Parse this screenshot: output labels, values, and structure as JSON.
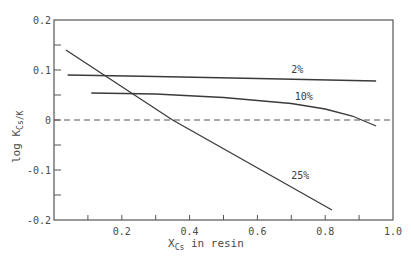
{
  "chart_data": {
    "type": "line",
    "title": "",
    "xlabel": "X_Cs in resin",
    "xlabel_main": "X",
    "xlabel_sub": "Cs",
    "xlabel_rest": " in resin",
    "ylabel": "log K_Cs/K",
    "ylabel_main": "log K",
    "ylabel_sub": "Cs/K",
    "xlim": [
      0.0,
      1.0
    ],
    "ylim": [
      -0.2,
      0.2
    ],
    "x_ticks": [
      0.2,
      0.4,
      0.6,
      0.8,
      1.0
    ],
    "x_tick_labels": [
      "0.2",
      "0.4",
      "0.6",
      "0.8",
      "1.0"
    ],
    "x_minor_ticks": [
      0.1,
      0.3,
      0.5,
      0.7,
      0.9
    ],
    "y_ticks": [
      -0.2,
      -0.1,
      0,
      0.1,
      0.2
    ],
    "y_tick_labels": [
      "-0.2",
      "-0.1",
      "0",
      "0.1",
      "0.2"
    ],
    "y_minor_ticks": [
      -0.15,
      -0.05,
      0.05,
      0.15
    ],
    "grid": false,
    "legend": "inline labels",
    "reference_line": {
      "y": 0,
      "style": "dashed"
    },
    "series": [
      {
        "name": "2%",
        "x": [
          0.04,
          0.3,
          0.6,
          0.95
        ],
        "y": [
          0.09,
          0.087,
          0.083,
          0.078
        ],
        "label_pos": [
          0.7,
          0.095
        ]
      },
      {
        "name": "10%",
        "x": [
          0.11,
          0.3,
          0.5,
          0.7,
          0.8,
          0.88,
          0.95
        ],
        "y": [
          0.054,
          0.052,
          0.045,
          0.033,
          0.022,
          0.008,
          -0.012
        ],
        "label_pos": [
          0.71,
          0.04
        ]
      },
      {
        "name": "25%",
        "x": [
          0.035,
          0.35,
          0.82
        ],
        "y": [
          0.14,
          0.0,
          -0.18
        ],
        "label_pos": [
          0.7,
          -0.118
        ]
      }
    ]
  }
}
